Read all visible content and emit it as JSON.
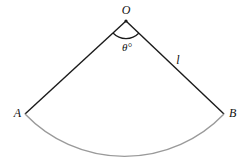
{
  "diagram": {
    "type": "circular-sector",
    "labels": {
      "center": "O",
      "left_point": "A",
      "right_point": "B",
      "angle": "θ°",
      "radius": "l"
    },
    "colors": {
      "radius_lines": "#1a1a1a",
      "arc": "#9a9a9a",
      "angle_mark": "#1a1a1a"
    }
  }
}
